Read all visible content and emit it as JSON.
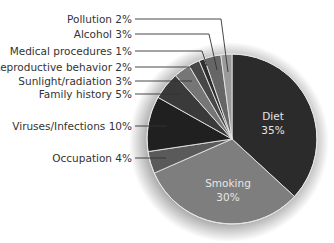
{
  "chart_data": {
    "type": "pie",
    "title": "",
    "categories": [
      "Diet",
      "Smoking",
      "Occupation",
      "Viruses/Infections",
      "Family history",
      "Sunlight/radiation",
      "Reproductive behavior",
      "Medical procedures",
      "Alcohol",
      "Pollution"
    ],
    "values": [
      35,
      30,
      4,
      10,
      5,
      3,
      2,
      1,
      3,
      2
    ],
    "unit": "%",
    "start_angle": "12 o'clock, clockwise",
    "slices": [
      {
        "label": "Diet",
        "value": 35,
        "display": "35%",
        "color": "#2b2b2b",
        "label_inside": true
      },
      {
        "label": "Smoking",
        "value": 30,
        "display": "30%",
        "color": "#7e7e7e",
        "label_inside": true
      },
      {
        "label": "Occupation",
        "value": 4,
        "display": "Occupation 4%",
        "color": "#5a5a5a",
        "label_inside": false
      },
      {
        "label": "Viruses/Infections",
        "value": 10,
        "display": "Viruses/Infections 10%",
        "color": "#202020",
        "label_inside": false
      },
      {
        "label": "Family history",
        "value": 5,
        "display": "Family history 5%",
        "color": "#3a3a3a",
        "label_inside": false
      },
      {
        "label": "Sunlight/radiation",
        "value": 3,
        "display": "Sunlight/radiation 3%",
        "color": "#767676",
        "label_inside": false
      },
      {
        "label": "Reproductive behavior",
        "value": 2,
        "display": "Reproductive behavior 2%",
        "color": "#474747",
        "label_inside": false
      },
      {
        "label": "Medical procedures",
        "value": 1,
        "display": "Medical procedures 1%",
        "color": "#2e2e2e",
        "label_inside": false
      },
      {
        "label": "Alcohol",
        "value": 3,
        "display": "Alcohol 3%",
        "color": "#666666",
        "label_inside": false
      },
      {
        "label": "Pollution",
        "value": 2,
        "display": "Pollution 2%",
        "color": "#9a9a9a",
        "label_inside": false
      }
    ],
    "legend": "none (leader-line callouts on left)"
  },
  "labels": {
    "diet_name": "Diet",
    "diet_pct": "35%",
    "smoking_name": "Smoking",
    "smoking_pct": "30%",
    "pollution": "Pollution 2%",
    "alcohol": "Alcohol 3%",
    "medical": "Medical procedures 1%",
    "reproductive": "Reproductive behavior 2%",
    "sunlight": "Sunlight/radiation 3%",
    "family": "Family history 5%",
    "viruses": "Viruses/Infections 10%",
    "occupation": "Occupation 4%"
  }
}
